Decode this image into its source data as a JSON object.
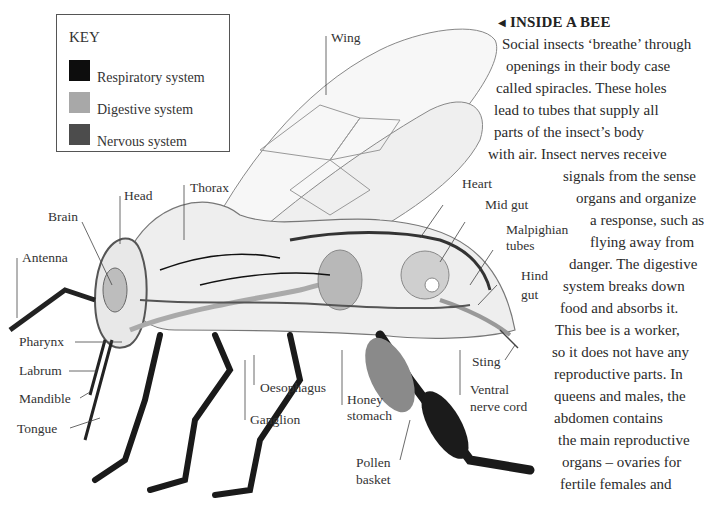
{
  "key": {
    "title": "KEY",
    "items": [
      {
        "label": "Respiratory system",
        "color": "#0d0d0d"
      },
      {
        "label": "Digestive system",
        "color": "#a8a8a8"
      },
      {
        "label": "Nervous system",
        "color": "#4c4c4c"
      }
    ]
  },
  "labels": {
    "wing": "Wing",
    "head": "Head",
    "thorax": "Thorax",
    "brain": "Brain",
    "antenna": "Antenna",
    "heart": "Heart",
    "mid_gut": "Mid gut",
    "malpighian_1": "Malpighian",
    "malpighian_2": "tubes",
    "hind_gut_1": "Hind",
    "hind_gut_2": "gut",
    "pharynx": "Pharynx",
    "labrum": "Labrum",
    "mandible": "Mandible",
    "tongue": "Tongue",
    "oesophagus": "Oesophagus",
    "ganglion": "Ganglion",
    "honey_stomach_1": "Honey",
    "honey_stomach_2": "stomach",
    "sting": "Sting",
    "ventral_nerve_cord_1": "Ventral",
    "ventral_nerve_cord_2": "nerve cord",
    "pollen_basket_1": "Pollen",
    "pollen_basket_2": "basket"
  },
  "article": {
    "title": "INSIDE A BEE",
    "title_arrow": "◀",
    "lines": [
      "Social insects ‘breathe’ through",
      "openings in their body case",
      "called spiracles. These holes",
      "lead to tubes that supply all",
      "parts of the insect’s body",
      "with air. Insect nerves receive",
      "signals from the sense",
      "organs and organize",
      "a response, such as",
      "flying away from",
      "danger. The digestive",
      "system breaks down",
      "food and absorbs it.",
      "This bee is a worker,",
      "so it does not have any",
      "reproductive parts. In",
      "queens and males, the",
      "abdomen contains",
      "the main reproductive",
      "organs – ovaries for",
      "fertile females and"
    ]
  }
}
